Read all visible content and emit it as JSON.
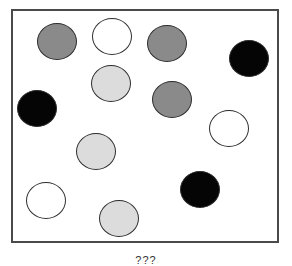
{
  "diagram": {
    "caption": "???",
    "frame": {
      "left": 11,
      "top": 9,
      "width": 268,
      "height": 234,
      "border_color": "#4a4a4a"
    },
    "colors": {
      "dark_gray": "#8a8a8a",
      "light_gray": "#dcdcdc",
      "black": "#050505",
      "white": "#ffffff",
      "outline": "#2e2e2e"
    },
    "circles": [
      {
        "fill": "dark_gray",
        "cx": 57,
        "cy": 41,
        "w": 40,
        "h": 37
      },
      {
        "fill": "white",
        "cx": 112,
        "cy": 36,
        "w": 40,
        "h": 37
      },
      {
        "fill": "dark_gray",
        "cx": 167,
        "cy": 43,
        "w": 40,
        "h": 37
      },
      {
        "fill": "black",
        "cx": 249,
        "cy": 58,
        "w": 40,
        "h": 37
      },
      {
        "fill": "light_gray",
        "cx": 111,
        "cy": 83,
        "w": 40,
        "h": 37
      },
      {
        "fill": "dark_gray",
        "cx": 172,
        "cy": 99,
        "w": 40,
        "h": 37
      },
      {
        "fill": "black",
        "cx": 37,
        "cy": 108,
        "w": 40,
        "h": 37
      },
      {
        "fill": "white",
        "cx": 229,
        "cy": 128,
        "w": 40,
        "h": 37
      },
      {
        "fill": "light_gray",
        "cx": 96,
        "cy": 151,
        "w": 40,
        "h": 37
      },
      {
        "fill": "black",
        "cx": 200,
        "cy": 189,
        "w": 40,
        "h": 37
      },
      {
        "fill": "white",
        "cx": 46,
        "cy": 200,
        "w": 40,
        "h": 37
      },
      {
        "fill": "light_gray",
        "cx": 119,
        "cy": 218,
        "w": 40,
        "h": 37
      }
    ],
    "counts": {
      "black": 3,
      "dark_gray": 3,
      "light_gray": 3,
      "white": 3
    }
  }
}
